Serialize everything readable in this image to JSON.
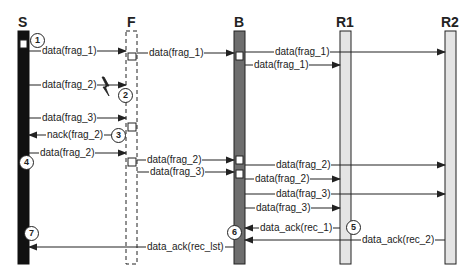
{
  "diagram": {
    "type": "sequence",
    "participants": [
      {
        "id": "S",
        "label": "S",
        "style": "black"
      },
      {
        "id": "F",
        "label": "F",
        "style": "dashed"
      },
      {
        "id": "B",
        "label": "B",
        "style": "dark-gray"
      },
      {
        "id": "R1",
        "label": "R1",
        "style": "light-gray"
      },
      {
        "id": "R2",
        "label": "R2",
        "style": "light-gray"
      }
    ],
    "messages": [
      {
        "from": "S",
        "to": "F",
        "label": "data(frag_1)"
      },
      {
        "from": "F",
        "to": "B",
        "label": "data(frag_1)"
      },
      {
        "from": "B",
        "to": "R2",
        "label": "data(frag_1)"
      },
      {
        "from": "B",
        "to": "R1",
        "label": "data(frag_1)"
      },
      {
        "from": "S",
        "to": "F",
        "label": "data(frag_2)",
        "lost": true
      },
      {
        "from": "S",
        "to": "F",
        "label": "data(frag_3)"
      },
      {
        "from": "F",
        "to": "S",
        "label": "nack(frag_2)"
      },
      {
        "from": "S",
        "to": "F",
        "label": "data(frag_2)"
      },
      {
        "from": "F",
        "to": "B",
        "label": "data(frag_2)"
      },
      {
        "from": "F",
        "to": "B",
        "label": "data(frag_3)"
      },
      {
        "from": "B",
        "to": "R2",
        "label": "data(frag_2)"
      },
      {
        "from": "B",
        "to": "R1",
        "label": "data(frag_2)"
      },
      {
        "from": "B",
        "to": "R2",
        "label": "data(frag_3)"
      },
      {
        "from": "B",
        "to": "R1",
        "label": "data(frag_3)"
      },
      {
        "from": "R1",
        "to": "B",
        "label": "data_ack(rec_1)"
      },
      {
        "from": "R2",
        "to": "B",
        "label": "data_ack(rec_2)"
      },
      {
        "from": "B",
        "to": "S",
        "label": "data_ack(rec_lst)"
      }
    ],
    "steps": [
      "1",
      "2",
      "3",
      "4",
      "5",
      "6",
      "7"
    ],
    "colors": {
      "line": "#222222",
      "sender_fill": "#111111",
      "bridge_fill": "#6e6e6e",
      "receiver_fill": "#e4e4e4",
      "background": "#ffffff"
    }
  }
}
